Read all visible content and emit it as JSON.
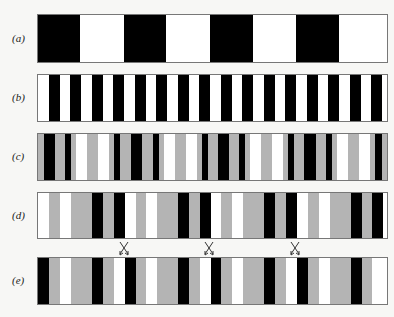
{
  "figure": {
    "colors": {
      "black": "#000000",
      "white": "#ffffff",
      "gray": "#b4b4b4",
      "border": "#777777",
      "background": "#f7f7f5"
    },
    "rows": [
      {
        "id": "a",
        "label": "(a)",
        "top": 14,
        "height": 49,
        "stripes": [
          {
            "x": 0,
            "w": 42,
            "c": "black"
          },
          {
            "x": 86,
            "w": 42,
            "c": "black"
          },
          {
            "x": 172,
            "w": 43,
            "c": "black"
          },
          {
            "x": 258,
            "w": 43,
            "c": "black"
          }
        ]
      },
      {
        "id": "b",
        "label": "(b)",
        "top": 74,
        "height": 48,
        "stripes": [
          {
            "x": 11,
            "w": 11,
            "c": "black"
          },
          {
            "x": 32,
            "w": 11,
            "c": "black"
          },
          {
            "x": 54,
            "w": 11,
            "c": "black"
          },
          {
            "x": 75,
            "w": 11,
            "c": "black"
          },
          {
            "x": 97,
            "w": 11,
            "c": "black"
          },
          {
            "x": 118,
            "w": 11,
            "c": "black"
          },
          {
            "x": 140,
            "w": 11,
            "c": "black"
          },
          {
            "x": 161,
            "w": 11,
            "c": "black"
          },
          {
            "x": 183,
            "w": 11,
            "c": "black"
          },
          {
            "x": 204,
            "w": 11,
            "c": "black"
          },
          {
            "x": 226,
            "w": 11,
            "c": "black"
          },
          {
            "x": 247,
            "w": 11,
            "c": "black"
          },
          {
            "x": 269,
            "w": 11,
            "c": "black"
          },
          {
            "x": 290,
            "w": 11,
            "c": "black"
          },
          {
            "x": 312,
            "w": 11,
            "c": "black"
          },
          {
            "x": 333,
            "w": 11,
            "c": "black"
          }
        ]
      },
      {
        "id": "c",
        "label": "(c)",
        "top": 133,
        "height": 48,
        "stripes": [
          {
            "x": 0,
            "w": 6,
            "c": "gray"
          },
          {
            "x": 6,
            "w": 11,
            "c": "black"
          },
          {
            "x": 17,
            "w": 10,
            "c": "gray"
          },
          {
            "x": 27,
            "w": 6,
            "c": "black"
          },
          {
            "x": 33,
            "w": 5,
            "c": "gray"
          },
          {
            "x": 38,
            "w": 11,
            "c": "white"
          },
          {
            "x": 49,
            "w": 11,
            "c": "gray"
          },
          {
            "x": 60,
            "w": 11,
            "c": "white"
          },
          {
            "x": 71,
            "w": 5,
            "c": "gray"
          },
          {
            "x": 76,
            "w": 6,
            "c": "black"
          },
          {
            "x": 82,
            "w": 11,
            "c": "gray"
          },
          {
            "x": 93,
            "w": 11,
            "c": "black"
          },
          {
            "x": 104,
            "w": 11,
            "c": "gray"
          },
          {
            "x": 115,
            "w": 6,
            "c": "black"
          },
          {
            "x": 121,
            "w": 5,
            "c": "gray"
          },
          {
            "x": 126,
            "w": 11,
            "c": "white"
          },
          {
            "x": 137,
            "w": 11,
            "c": "gray"
          },
          {
            "x": 148,
            "w": 11,
            "c": "white"
          },
          {
            "x": 159,
            "w": 5,
            "c": "gray"
          },
          {
            "x": 164,
            "w": 6,
            "c": "black"
          },
          {
            "x": 170,
            "w": 10,
            "c": "gray"
          },
          {
            "x": 180,
            "w": 11,
            "c": "black"
          },
          {
            "x": 191,
            "w": 10,
            "c": "gray"
          },
          {
            "x": 201,
            "w": 6,
            "c": "black"
          },
          {
            "x": 207,
            "w": 5,
            "c": "gray"
          },
          {
            "x": 212,
            "w": 11,
            "c": "white"
          },
          {
            "x": 223,
            "w": 11,
            "c": "gray"
          },
          {
            "x": 234,
            "w": 11,
            "c": "white"
          },
          {
            "x": 245,
            "w": 5,
            "c": "gray"
          },
          {
            "x": 250,
            "w": 6,
            "c": "black"
          },
          {
            "x": 256,
            "w": 10,
            "c": "gray"
          },
          {
            "x": 266,
            "w": 12,
            "c": "black"
          },
          {
            "x": 278,
            "w": 10,
            "c": "gray"
          },
          {
            "x": 288,
            "w": 6,
            "c": "black"
          },
          {
            "x": 294,
            "w": 5,
            "c": "gray"
          },
          {
            "x": 299,
            "w": 11,
            "c": "white"
          },
          {
            "x": 310,
            "w": 11,
            "c": "gray"
          },
          {
            "x": 321,
            "w": 11,
            "c": "white"
          },
          {
            "x": 332,
            "w": 5,
            "c": "gray"
          },
          {
            "x": 337,
            "w": 7,
            "c": "black"
          },
          {
            "x": 344,
            "w": 7,
            "c": "gray"
          }
        ]
      },
      {
        "id": "d",
        "label": "(d)",
        "top": 192,
        "height": 47,
        "stripes": [
          {
            "x": 0,
            "w": 11,
            "c": "white"
          },
          {
            "x": 11,
            "w": 11,
            "c": "gray"
          },
          {
            "x": 22,
            "w": 11,
            "c": "white"
          },
          {
            "x": 33,
            "w": 21,
            "c": "gray"
          },
          {
            "x": 54,
            "w": 11,
            "c": "black"
          },
          {
            "x": 65,
            "w": 11,
            "c": "gray"
          },
          {
            "x": 76,
            "w": 11,
            "c": "black"
          },
          {
            "x": 87,
            "w": 11,
            "c": "white"
          },
          {
            "x": 98,
            "w": 10,
            "c": "gray"
          },
          {
            "x": 108,
            "w": 11,
            "c": "white"
          },
          {
            "x": 119,
            "w": 21,
            "c": "gray"
          },
          {
            "x": 140,
            "w": 11,
            "c": "black"
          },
          {
            "x": 151,
            "w": 11,
            "c": "gray"
          },
          {
            "x": 162,
            "w": 11,
            "c": "black"
          },
          {
            "x": 173,
            "w": 10,
            "c": "white"
          },
          {
            "x": 183,
            "w": 11,
            "c": "gray"
          },
          {
            "x": 194,
            "w": 11,
            "c": "white"
          },
          {
            "x": 205,
            "w": 21,
            "c": "gray"
          },
          {
            "x": 226,
            "w": 11,
            "c": "black"
          },
          {
            "x": 237,
            "w": 11,
            "c": "gray"
          },
          {
            "x": 248,
            "w": 11,
            "c": "black"
          },
          {
            "x": 259,
            "w": 11,
            "c": "white"
          },
          {
            "x": 270,
            "w": 11,
            "c": "gray"
          },
          {
            "x": 281,
            "w": 11,
            "c": "white"
          },
          {
            "x": 292,
            "w": 21,
            "c": "gray"
          },
          {
            "x": 313,
            "w": 11,
            "c": "black"
          },
          {
            "x": 324,
            "w": 10,
            "c": "gray"
          },
          {
            "x": 334,
            "w": 11,
            "c": "black"
          },
          {
            "x": 345,
            "w": 6,
            "c": "white"
          }
        ]
      },
      {
        "id": "e",
        "label": "(e)",
        "top": 257,
        "height": 48,
        "stripes": [
          {
            "x": 0,
            "w": 11,
            "c": "black"
          },
          {
            "x": 11,
            "w": 11,
            "c": "gray"
          },
          {
            "x": 22,
            "w": 11,
            "c": "white"
          },
          {
            "x": 33,
            "w": 21,
            "c": "gray"
          },
          {
            "x": 54,
            "w": 11,
            "c": "black"
          },
          {
            "x": 65,
            "w": 11,
            "c": "gray"
          },
          {
            "x": 76,
            "w": 11,
            "c": "white"
          },
          {
            "x": 87,
            "w": 11,
            "c": "black"
          },
          {
            "x": 98,
            "w": 10,
            "c": "gray"
          },
          {
            "x": 108,
            "w": 11,
            "c": "white"
          },
          {
            "x": 119,
            "w": 21,
            "c": "gray"
          },
          {
            "x": 140,
            "w": 11,
            "c": "black"
          },
          {
            "x": 151,
            "w": 11,
            "c": "gray"
          },
          {
            "x": 162,
            "w": 11,
            "c": "white"
          },
          {
            "x": 173,
            "w": 10,
            "c": "black"
          },
          {
            "x": 183,
            "w": 11,
            "c": "gray"
          },
          {
            "x": 194,
            "w": 11,
            "c": "white"
          },
          {
            "x": 205,
            "w": 21,
            "c": "gray"
          },
          {
            "x": 226,
            "w": 11,
            "c": "black"
          },
          {
            "x": 237,
            "w": 11,
            "c": "gray"
          },
          {
            "x": 248,
            "w": 11,
            "c": "white"
          },
          {
            "x": 259,
            "w": 11,
            "c": "black"
          },
          {
            "x": 270,
            "w": 11,
            "c": "gray"
          },
          {
            "x": 281,
            "w": 11,
            "c": "white"
          },
          {
            "x": 292,
            "w": 21,
            "c": "gray"
          },
          {
            "x": 313,
            "w": 11,
            "c": "black"
          },
          {
            "x": 324,
            "w": 10,
            "c": "gray"
          },
          {
            "x": 334,
            "w": 11,
            "c": "white"
          },
          {
            "x": 345,
            "w": 6,
            "c": "white"
          }
        ]
      }
    ],
    "swap_arrows": [
      {
        "x": 117,
        "y": 241
      },
      {
        "x": 202,
        "y": 241
      },
      {
        "x": 288,
        "y": 241
      }
    ]
  }
}
